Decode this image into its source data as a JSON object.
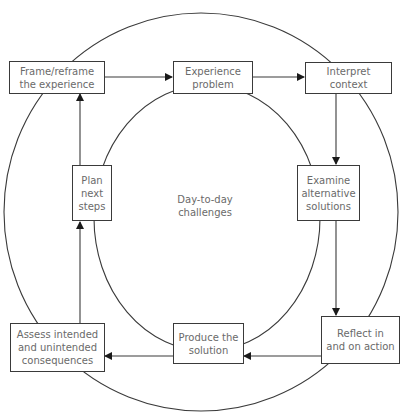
{
  "diagram": {
    "center_label": "Day-to-day\nchallenges",
    "nodes": [
      {
        "id": "frame",
        "label": "Frame/reframe\nthe experience"
      },
      {
        "id": "experience",
        "label": "Experience\nproblem"
      },
      {
        "id": "interpret",
        "label": "Interpret\ncontext"
      },
      {
        "id": "examine",
        "label": "Examine\nalternative\nsolutions"
      },
      {
        "id": "reflect",
        "label": "Reflect in\nand on action"
      },
      {
        "id": "produce",
        "label": "Produce the\nsolution"
      },
      {
        "id": "assess",
        "label": "Assess intended\nand unintended\nconsequences"
      },
      {
        "id": "plan",
        "label": "Plan\nnext\nsteps"
      }
    ],
    "edges": [
      {
        "from": "frame",
        "to": "experience"
      },
      {
        "from": "experience",
        "to": "interpret"
      },
      {
        "from": "interpret",
        "to": "examine"
      },
      {
        "from": "examine",
        "to": "reflect"
      },
      {
        "from": "reflect",
        "to": "produce"
      },
      {
        "from": "produce",
        "to": "assess"
      },
      {
        "from": "assess",
        "to": "plan"
      },
      {
        "from": "plan",
        "to": "frame"
      }
    ],
    "colors": {
      "line": "#3a3a3a",
      "text": "#6a6a6a",
      "background": "#ffffff"
    }
  }
}
